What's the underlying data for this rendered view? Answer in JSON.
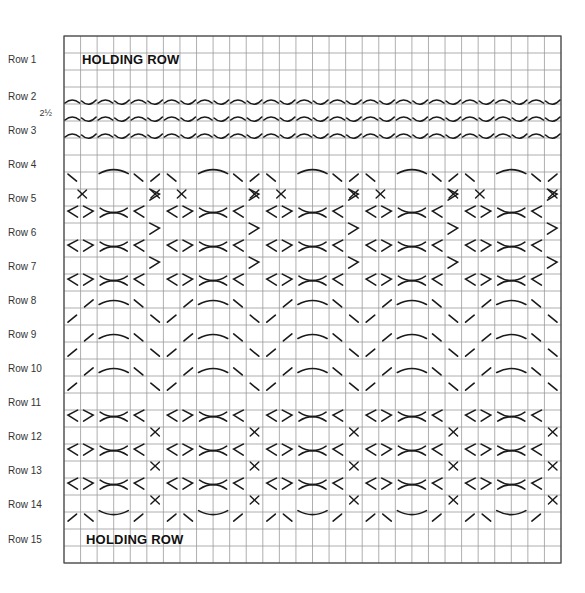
{
  "diagram": {
    "type": "knitting-stitch-chart",
    "grid": {
      "left": 64,
      "top": 36,
      "right": 561,
      "bottom": 563,
      "cols": 30,
      "rows": 31,
      "line_color": "#9a9a9a",
      "border_color": "#444444"
    },
    "stroke_color": "#1a1a1a",
    "repeat_width_cols": 6
  },
  "labels": {
    "holding_row_top": "HOLDING ROW",
    "holding_row_bottom": "HOLDING ROW"
  },
  "rows": [
    {
      "label": "Row 1",
      "y": 60
    },
    {
      "label": "Row 2",
      "y": 97
    },
    {
      "label": "2½",
      "y": 114,
      "half": true
    },
    {
      "label": "Row 3",
      "y": 131
    },
    {
      "label": "Row 4",
      "y": 165
    },
    {
      "label": "Row 5",
      "y": 199
    },
    {
      "label": "Row 6",
      "y": 233
    },
    {
      "label": "Row 7",
      "y": 267
    },
    {
      "label": "Row 8",
      "y": 301
    },
    {
      "label": "Row 9",
      "y": 335
    },
    {
      "label": "Row 10",
      "y": 369
    },
    {
      "label": "Row 11",
      "y": 403
    },
    {
      "label": "Row 12",
      "y": 437
    },
    {
      "label": "Row 13",
      "y": 471
    },
    {
      "label": "Row 14",
      "y": 505
    },
    {
      "label": "Row 15",
      "y": 540
    }
  ]
}
